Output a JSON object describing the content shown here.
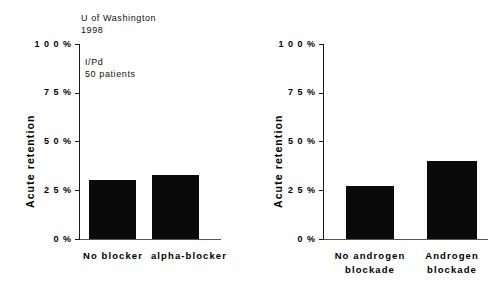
{
  "chart_data": [
    {
      "type": "bar",
      "panel": "left",
      "title": "",
      "xlabel": "",
      "ylabel": "Acute retention",
      "categories": [
        "No blocker",
        "alpha-blocker"
      ],
      "values": [
        30,
        33
      ],
      "ylim": [
        0,
        100
      ],
      "yticks": [
        0,
        25,
        50,
        75,
        100
      ],
      "ytick_labels": [
        "0 %",
        "2 5 %",
        "5 0 %",
        "7 5 %",
        "1 0 0 %"
      ],
      "grid": false,
      "legend": "none",
      "annotations": [
        {
          "text": "U of Washington",
          "line": 1
        },
        {
          "text": "1998",
          "line": 2
        },
        {
          "text": "I/Pd",
          "line": 3
        },
        {
          "text": "50 patients",
          "line": 4
        }
      ],
      "bar_color": "#0a0a0a"
    },
    {
      "type": "bar",
      "panel": "right",
      "title": "",
      "xlabel": "",
      "ylabel": "Acute retention",
      "categories": [
        "No androgen blockade",
        "Androgen blockade"
      ],
      "values": [
        27,
        40
      ],
      "ylim": [
        0,
        100
      ],
      "yticks": [
        0,
        25,
        50,
        75,
        100
      ],
      "ytick_labels": [
        "0 %",
        "2 5 %",
        "5 0 %",
        "7 5 %",
        "1 0 0 %"
      ],
      "grid": false,
      "legend": "none",
      "bar_color": "#0a0a0a"
    }
  ],
  "left_chart": {
    "ylabel": "Acute retention",
    "ticks": {
      "t100": "1 0 0 %",
      "t75": "7 5 %",
      "t50": "5 0 %",
      "t25": "2 5 %",
      "t0": "0 %"
    },
    "annotation": {
      "source": "U of Washington",
      "year": "1998",
      "drug": "I/Pd",
      "sample": "50 patients"
    },
    "bars": [
      {
        "label": "No blocker",
        "value": 30
      },
      {
        "label": "alpha-blocker",
        "value": 33
      }
    ]
  },
  "right_chart": {
    "ylabel": "Acute retention",
    "ticks": {
      "t100": "1 0 0 %",
      "t75": "7 5 %",
      "t50": "5 0 %",
      "t25": "2 5 %",
      "t0": "0 %"
    },
    "bars": [
      {
        "label_line1": "No androgen",
        "label_line2": "blockade",
        "value": 27
      },
      {
        "label_line1": "Androgen",
        "label_line2": "blockade",
        "value": 40
      }
    ]
  }
}
